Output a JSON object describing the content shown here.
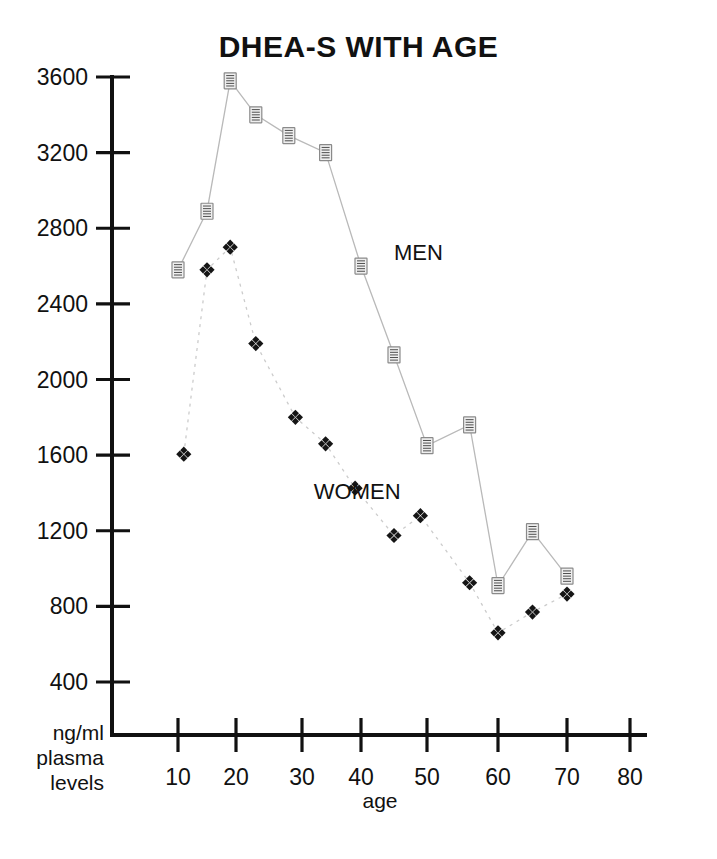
{
  "chart_data": {
    "type": "line",
    "title": "DHEA-S WITH AGE",
    "xlabel": "age",
    "ylabel": "ng/ml plasma levels",
    "ylabel_lines": [
      "ng/ml",
      "plasma",
      "levels"
    ],
    "xlim": [
      0,
      85
    ],
    "ylim": [
      200,
      3700
    ],
    "grid": false,
    "legend_position": "inline-annotation",
    "x_ticks": [
      10,
      20,
      30,
      40,
      50,
      60,
      70,
      80
    ],
    "x_tick_labels": [
      "10",
      "20",
      "30",
      "40",
      "50",
      "60",
      "70",
      "80"
    ],
    "y_ticks": [
      400,
      800,
      1200,
      1600,
      2000,
      2400,
      2800,
      3200,
      3600
    ],
    "y_tick_labels": [
      "400",
      "800",
      "1200",
      "1600",
      "2000",
      "2400",
      "2800",
      "3200",
      "3600"
    ],
    "series": [
      {
        "name": "MEN",
        "marker": "small-document-square",
        "marker_color": "#efefef",
        "line_color": "#b9b9b9",
        "x": [
          10,
          15,
          19,
          23,
          28,
          34,
          40,
          45,
          50,
          56,
          60,
          65,
          70
        ],
        "values": [
          2580,
          2890,
          3580,
          3400,
          3290,
          3200,
          2600,
          2130,
          1650,
          1760,
          910,
          1195,
          960
        ]
      },
      {
        "name": "WOMEN",
        "marker": "four-diamond-cluster",
        "marker_color": "#151515",
        "line_color": "#cccccc",
        "x": [
          11,
          15,
          19,
          23,
          29,
          34,
          39,
          45,
          49,
          56,
          60,
          65,
          70
        ],
        "values": [
          1605,
          2580,
          2700,
          2190,
          1800,
          1660,
          1425,
          1175,
          1280,
          925,
          660,
          770,
          865
        ]
      }
    ],
    "annotations": [
      {
        "text": "MEN",
        "x": 45,
        "y": 2630
      },
      {
        "text": "WOMEN",
        "x": 32,
        "y": 1370
      }
    ]
  },
  "colors": {
    "axis": "#111111",
    "background": "#ffffff",
    "men_line": "#b9b9b9",
    "women_line": "#cccccc",
    "text": "#111111"
  }
}
